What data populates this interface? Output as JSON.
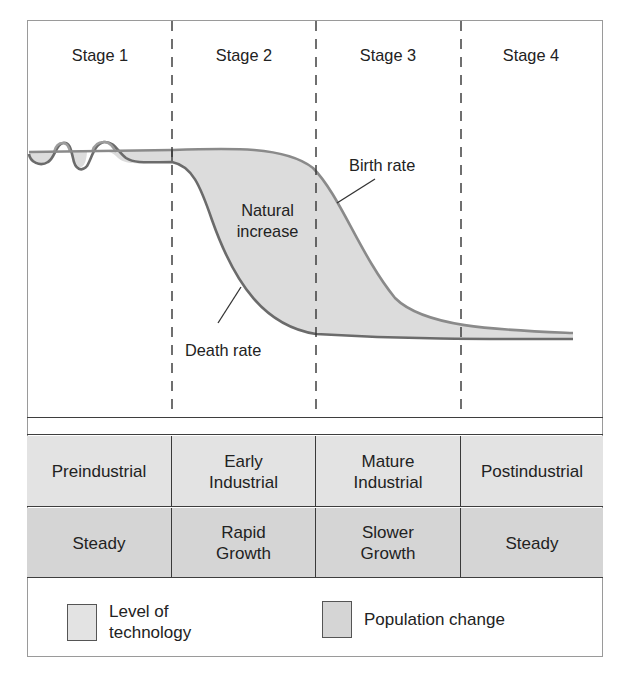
{
  "stages": [
    {
      "label": "Stage 1"
    },
    {
      "label": "Stage 2"
    },
    {
      "label": "Stage 3"
    },
    {
      "label": "Stage 4"
    }
  ],
  "curves": {
    "birth_rate_label": "Birth rate",
    "death_rate_label": "Death rate",
    "natural_increase_label_line1": "Natural",
    "natural_increase_label_line2": "increase"
  },
  "table": {
    "technology_row": [
      {
        "line1": "Preindustrial",
        "line2": ""
      },
      {
        "line1": "Early",
        "line2": "Industrial"
      },
      {
        "line1": "Mature",
        "line2": "Industrial"
      },
      {
        "line1": "Postindustrial",
        "line2": ""
      }
    ],
    "population_row": [
      {
        "line1": "Steady",
        "line2": ""
      },
      {
        "line1": "Rapid",
        "line2": "Growth"
      },
      {
        "line1": "Slower",
        "line2": "Growth"
      },
      {
        "line1": "Steady",
        "line2": ""
      }
    ]
  },
  "legend": {
    "items": [
      {
        "line1": "Level of",
        "line2": "technology",
        "color": "#e3e3e3"
      },
      {
        "line1": "Population change",
        "line2": "",
        "color": "#d5d5d5"
      }
    ]
  },
  "colors": {
    "fill": "#dcdcdc",
    "death_line": "#6b6b6b",
    "birth_line": "#8a8a8a",
    "divider": "#3a3a3a",
    "row_tech": "#e3e3e3",
    "row_pop": "#d5d5d5"
  }
}
